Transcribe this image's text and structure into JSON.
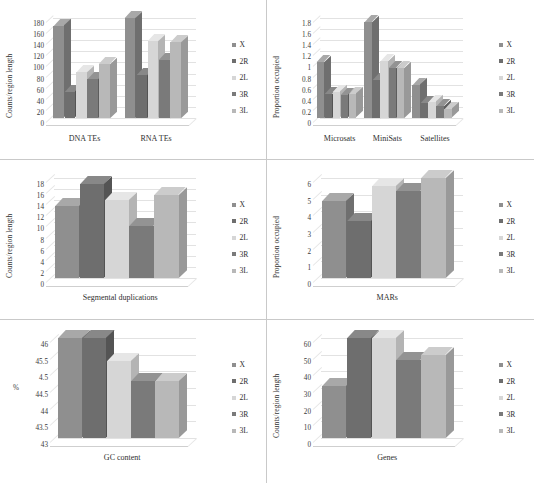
{
  "figure": {
    "layout": "2 columns x 3 rows of bar charts",
    "legend_entries": [
      "X",
      "2R",
      "2L",
      "3R",
      "3L"
    ],
    "series_colors": [
      "#8f8f8f",
      "#6e6e6e",
      "#d6d6d6",
      "#7a7a7a",
      "#b8b8b8"
    ],
    "series_top_colors": [
      "#a8a8a8",
      "#888888",
      "#e6e6e6",
      "#939393",
      "#cccccc"
    ],
    "series_side_colors": [
      "#6f6f6f",
      "#545454",
      "#b4b4b4",
      "#5d5d5d",
      "#999999"
    ]
  },
  "chart_data": [
    {
      "id": "transposable-elements",
      "type": "bar",
      "title": "",
      "xlabel": "",
      "ylabel": "Counts/region length",
      "categories": [
        "DNA TEs",
        "RNA TEs"
      ],
      "ticks": [
        0,
        20,
        40,
        60,
        80,
        100,
        120,
        140,
        160,
        180
      ],
      "ylim": [
        0,
        180
      ],
      "grid": true,
      "legend_position": "right",
      "series": [
        {
          "name": "X",
          "values": [
            166,
            181
          ]
        },
        {
          "name": "2R",
          "values": [
            47,
            77
          ]
        },
        {
          "name": "2L",
          "values": [
            82,
            138
          ]
        },
        {
          "name": "3R",
          "values": [
            70,
            104
          ]
        },
        {
          "name": "3L",
          "values": [
            97,
            136
          ]
        }
      ]
    },
    {
      "id": "satellites",
      "type": "bar",
      "title": "",
      "xlabel": "",
      "ylabel": "Proportion occupied",
      "categories": [
        "Microsats",
        "MiniSats",
        "Satellites"
      ],
      "ticks": [
        0,
        0.2,
        0.4,
        0.6,
        0.8,
        1,
        1.2,
        1.4,
        1.6,
        1.8
      ],
      "tick_labels": [
        "0",
        "0.2",
        "0.4",
        "0.6",
        "0.8",
        "1",
        "1.2",
        "1.4",
        "1.6",
        "1.8"
      ],
      "ylim": [
        0,
        1.8
      ],
      "grid": true,
      "legend_position": "right",
      "series": [
        {
          "name": "X",
          "values": [
            1.0,
            1.72,
            0.6
          ]
        },
        {
          "name": "2R",
          "values": [
            0.43,
            0.68,
            0.27
          ]
        },
        {
          "name": "2L",
          "values": [
            0.47,
            1.02,
            0.29
          ]
        },
        {
          "name": "3R",
          "values": [
            0.42,
            0.9,
            0.21
          ]
        },
        {
          "name": "3L",
          "values": [
            0.44,
            0.9,
            0.17
          ]
        }
      ]
    },
    {
      "id": "segmental-duplications",
      "type": "bar",
      "title": "",
      "xlabel": "Segmental duplications",
      "ylabel": "Counts/region length",
      "categories": [
        "Segmental duplications"
      ],
      "ticks": [
        0,
        2,
        4,
        6,
        8,
        10,
        12,
        14,
        16,
        18
      ],
      "ylim": [
        0,
        18
      ],
      "grid": true,
      "legend_position": "right",
      "series": [
        {
          "name": "X",
          "values": [
            13.0
          ]
        },
        {
          "name": "2R",
          "values": [
            17.0
          ]
        },
        {
          "name": "2L",
          "values": [
            14.0
          ]
        },
        {
          "name": "3R",
          "values": [
            9.4
          ]
        },
        {
          "name": "3L",
          "values": [
            15.0
          ]
        }
      ]
    },
    {
      "id": "mars",
      "type": "bar",
      "title": "",
      "xlabel": "MARs",
      "ylabel": "Proportion occupied",
      "categories": [
        "MARs"
      ],
      "ticks": [
        0,
        1,
        2,
        3,
        4,
        5,
        6
      ],
      "ylim": [
        0,
        6
      ],
      "grid": true,
      "legend_position": "right",
      "series": [
        {
          "name": "X",
          "values": [
            4.6
          ]
        },
        {
          "name": "2R",
          "values": [
            3.4
          ]
        },
        {
          "name": "2L",
          "values": [
            5.5
          ]
        },
        {
          "name": "3R",
          "values": [
            5.2
          ]
        },
        {
          "name": "3L",
          "values": [
            6.0
          ]
        }
      ]
    },
    {
      "id": "gc-content",
      "type": "bar",
      "title": "",
      "xlabel": "GC content",
      "ylabel": "%",
      "categories": [
        "GC content"
      ],
      "ticks": [
        43,
        43.5,
        44,
        44.5,
        45,
        45.5,
        46
      ],
      "tick_labels": [
        "43",
        "43.5",
        "44",
        "44.5",
        "4.5",
        "45.5",
        "46"
      ],
      "ylim": [
        43,
        46
      ],
      "grid": true,
      "legend_position": "right",
      "series": [
        {
          "name": "X",
          "values": [
            46.0
          ]
        },
        {
          "name": "2R",
          "values": [
            46.0
          ]
        },
        {
          "name": "2L",
          "values": [
            45.3
          ]
        },
        {
          "name": "3R",
          "values": [
            44.7
          ]
        },
        {
          "name": "3L",
          "values": [
            44.7
          ]
        }
      ]
    },
    {
      "id": "genes",
      "type": "bar",
      "title": "",
      "xlabel": "Genes",
      "ylabel": "Counts/region length",
      "categories": [
        "Genes"
      ],
      "ticks": [
        0,
        10,
        20,
        30,
        40,
        50,
        60
      ],
      "ylim": [
        0,
        60
      ],
      "grid": true,
      "legend_position": "right",
      "series": [
        {
          "name": "X",
          "values": [
            31.0
          ]
        },
        {
          "name": "2R",
          "values": [
            61.0
          ]
        },
        {
          "name": "2L",
          "values": [
            60.0
          ]
        },
        {
          "name": "3R",
          "values": [
            47.0
          ]
        },
        {
          "name": "3L",
          "values": [
            50.0
          ]
        }
      ]
    }
  ]
}
